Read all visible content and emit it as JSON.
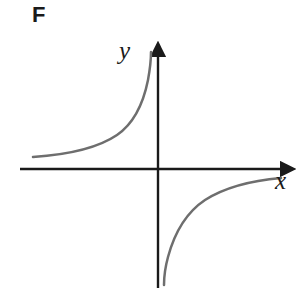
{
  "figure": {
    "panel_label": "F",
    "background_color": "#ffffff"
  },
  "axes": {
    "x_label": "x",
    "y_label": "y",
    "axis_color": "#1a1a1a",
    "origin": {
      "x": 158,
      "y": 169
    },
    "x_axis": {
      "start_x": 20,
      "end_x": 296,
      "y": 169,
      "arrow": "right"
    },
    "y_axis": {
      "x": 158,
      "top_y": 40,
      "bottom_y": 288,
      "arrow": "up"
    }
  },
  "curve": {
    "color": "#6e6e6e",
    "stroke_width": 2.5,
    "name": "reciprocal-hyperbola"
  },
  "chart_data": {
    "type": "line",
    "title": "F",
    "xlabel": "x",
    "ylabel": "y",
    "grid": false,
    "legend": null,
    "axis_arrows": {
      "x": "right",
      "y": "up"
    },
    "xlim": [
      -5.6,
      5.6
    ],
    "ylim": [
      -4.8,
      5.2
    ],
    "asymptotes": {
      "vertical": 0,
      "horizontal": 0
    },
    "series": [
      {
        "name": "branch-upper-left",
        "quadrant": "II",
        "x": [
          -5.2,
          -4.6,
          -4.0,
          -3.4,
          -2.8,
          -2.4,
          -2.0,
          -1.7,
          -1.4,
          -1.2,
          -1.0,
          -0.85,
          -0.7,
          -0.55,
          -0.42,
          -0.33
        ],
        "y": [
          0.23,
          0.26,
          0.3,
          0.35,
          0.43,
          0.5,
          0.6,
          0.71,
          0.86,
          1.0,
          1.2,
          1.41,
          1.71,
          2.18,
          2.86,
          3.64
        ]
      },
      {
        "name": "branch-lower-right",
        "quadrant": "IV",
        "x": [
          0.2,
          0.26,
          0.33,
          0.42,
          0.55,
          0.7,
          0.85,
          1.0,
          1.2,
          1.4,
          1.7,
          2.0,
          2.4,
          2.8,
          3.4,
          4.0,
          4.6,
          5.0
        ],
        "y": [
          -4.6,
          -3.85,
          -3.03,
          -2.38,
          -1.82,
          -1.43,
          -1.18,
          -1.0,
          -0.83,
          -0.71,
          -0.59,
          -0.5,
          -0.42,
          -0.36,
          -0.29,
          -0.25,
          -0.22,
          -0.2
        ]
      }
    ]
  }
}
